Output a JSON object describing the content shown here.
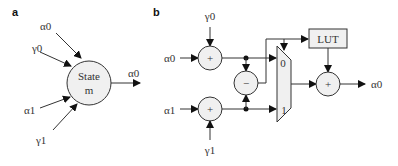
{
  "panel_a": {
    "label": "a",
    "state_node": {
      "line1": "State",
      "line2": "m"
    },
    "inputs": [
      "α0",
      "γ0",
      "α1",
      "γ1"
    ],
    "output": "α0"
  },
  "panel_b": {
    "label": "b",
    "inputs": {
      "alpha0": "α0",
      "gamma0": "γ0",
      "alpha1": "α1",
      "gamma1": "γ1"
    },
    "adder_top": "+",
    "adder_bottom": "+",
    "subtractor": "−",
    "mux": {
      "in0": "0",
      "in1": "1"
    },
    "lut": "LUT",
    "adder_out": "+",
    "output": "α0"
  }
}
